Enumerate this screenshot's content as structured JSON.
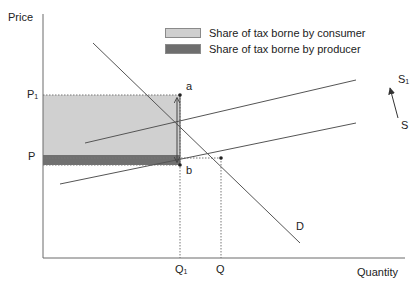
{
  "diagram": {
    "axes": {
      "y_label": "Price",
      "x_label": "Quantity"
    },
    "curves": {
      "demand": "D",
      "supply": "S",
      "supply_shifted": "S",
      "supply_shifted_sub": "1"
    },
    "points": {
      "a": "a",
      "b": "b"
    },
    "price_ticks": {
      "p1": "P",
      "p1_sub": "1",
      "p": "P"
    },
    "quantity_ticks": {
      "q1": "Q",
      "q1_sub": "1",
      "q": "Q"
    },
    "legend": {
      "items": [
        {
          "label": "Share of tax borne by consumer",
          "color": "#cfcfcf"
        },
        {
          "label": "Share of tax borne by producer",
          "color": "#6e6e6e"
        }
      ]
    },
    "colors": {
      "axis": "#6a6a6a",
      "line": "#555555",
      "consumer_area": "#d0d0d0",
      "producer_area": "#707070"
    }
  }
}
